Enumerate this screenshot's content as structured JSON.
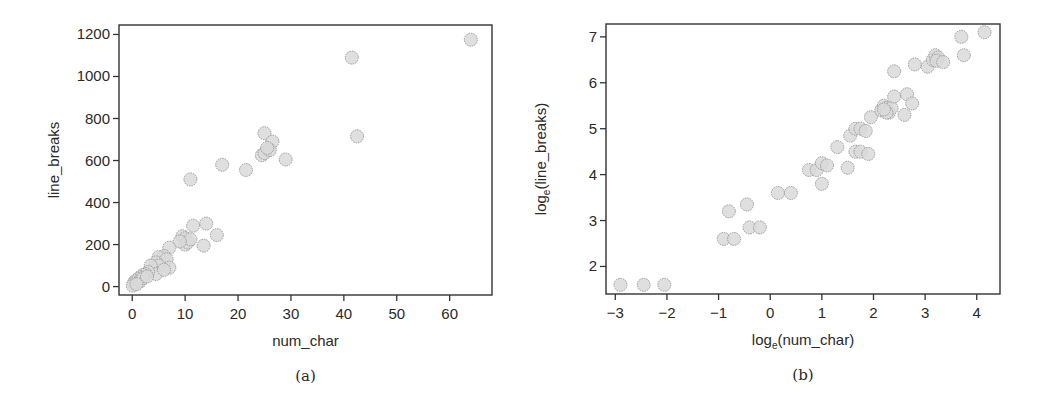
{
  "chart_data": [
    {
      "id": "a",
      "type": "scatter",
      "caption": "(a)",
      "title": "",
      "xlabel": "num_char",
      "ylabel": "line_breaks",
      "xlim": [
        -2.5,
        68
      ],
      "ylim": [
        -40,
        1245
      ],
      "xticks": [
        0,
        10,
        20,
        30,
        40,
        50,
        60
      ],
      "yticks": [
        0,
        200,
        400,
        600,
        800,
        1000,
        1200
      ],
      "grid": false,
      "legend": "none",
      "marker": {
        "fill": "#d9d9d9",
        "stroke": "#9a9a9a",
        "radius": 6.5
      },
      "points": [
        [
          64,
          1175
        ],
        [
          41.5,
          1090
        ],
        [
          42.5,
          715
        ],
        [
          25,
          730
        ],
        [
          26.5,
          690
        ],
        [
          24.5,
          625
        ],
        [
          25,
          635
        ],
        [
          26,
          650
        ],
        [
          25.5,
          660
        ],
        [
          29,
          605
        ],
        [
          17,
          580
        ],
        [
          21.5,
          555
        ],
        [
          11,
          510
        ],
        [
          11.5,
          290
        ],
        [
          14,
          300
        ],
        [
          16,
          245
        ],
        [
          13.5,
          195
        ],
        [
          9.5,
          240
        ],
        [
          10,
          230
        ],
        [
          10,
          200
        ],
        [
          10.5,
          210
        ],
        [
          11,
          225
        ],
        [
          9,
          215
        ],
        [
          7,
          185
        ],
        [
          6,
          145
        ],
        [
          5,
          140
        ],
        [
          6.5,
          130
        ],
        [
          7,
          90
        ],
        [
          4.5,
          115
        ],
        [
          5,
          100
        ],
        [
          3.5,
          100
        ],
        [
          4.5,
          60
        ],
        [
          6,
          80
        ],
        [
          3,
          70
        ],
        [
          2.5,
          60
        ],
        [
          2,
          55
        ],
        [
          1.5,
          45
        ],
        [
          1,
          35
        ],
        [
          0.5,
          25
        ],
        [
          0.3,
          15
        ],
        [
          0.1,
          5
        ],
        [
          1.5,
          25
        ],
        [
          2,
          40
        ],
        [
          0.8,
          12
        ],
        [
          2.8,
          48
        ]
      ]
    },
    {
      "id": "b",
      "type": "scatter",
      "caption": "(b)",
      "title": "",
      "xlabel": "log_e(num_char)",
      "ylabel": "log_e(line_breaks)",
      "xlim": [
        -3.18,
        4.45
      ],
      "ylim": [
        1.4,
        7.28
      ],
      "xticks": [
        -3,
        -2,
        -1,
        0,
        1,
        2,
        3,
        4
      ],
      "yticks": [
        2,
        3,
        4,
        5,
        6,
        7
      ],
      "grid": false,
      "legend": "none",
      "marker": {
        "fill": "#d9d9d9",
        "stroke": "#9a9a9a",
        "radius": 6.5
      },
      "points": [
        [
          -2.9,
          1.6
        ],
        [
          -2.45,
          1.6
        ],
        [
          -2.05,
          1.6
        ],
        [
          -0.9,
          2.6
        ],
        [
          -0.7,
          2.6
        ],
        [
          -0.8,
          3.2
        ],
        [
          -0.45,
          3.35
        ],
        [
          -0.4,
          2.85
        ],
        [
          -0.2,
          2.85
        ],
        [
          0.15,
          3.6
        ],
        [
          0.4,
          3.6
        ],
        [
          0.75,
          4.1
        ],
        [
          0.9,
          4.1
        ],
        [
          1.0,
          4.25
        ],
        [
          1.1,
          4.2
        ],
        [
          1.0,
          3.8
        ],
        [
          1.3,
          4.6
        ],
        [
          1.5,
          4.15
        ],
        [
          1.55,
          4.85
        ],
        [
          1.65,
          5.0
        ],
        [
          1.75,
          5.0
        ],
        [
          1.85,
          4.95
        ],
        [
          1.65,
          4.5
        ],
        [
          1.75,
          4.5
        ],
        [
          1.9,
          4.45
        ],
        [
          1.95,
          5.25
        ],
        [
          2.15,
          5.4
        ],
        [
          2.2,
          5.5
        ],
        [
          2.25,
          5.45
        ],
        [
          2.3,
          5.35
        ],
        [
          2.35,
          5.45
        ],
        [
          2.25,
          5.35
        ],
        [
          2.2,
          5.42
        ],
        [
          2.4,
          5.7
        ],
        [
          2.4,
          6.25
        ],
        [
          2.6,
          5.3
        ],
        [
          2.65,
          5.75
        ],
        [
          2.75,
          5.55
        ],
        [
          2.8,
          6.4
        ],
        [
          3.05,
          6.35
        ],
        [
          3.15,
          6.5
        ],
        [
          3.2,
          6.6
        ],
        [
          3.25,
          6.55
        ],
        [
          3.22,
          6.48
        ],
        [
          3.35,
          6.45
        ],
        [
          3.7,
          7.0
        ],
        [
          3.75,
          6.6
        ],
        [
          4.15,
          7.1
        ]
      ]
    }
  ],
  "layout": {
    "a": {
      "box": [
        119,
        25,
        492,
        295
      ],
      "xtick_y_len": 5
    },
    "b": {
      "box": [
        86,
        24,
        480,
        294
      ]
    }
  }
}
